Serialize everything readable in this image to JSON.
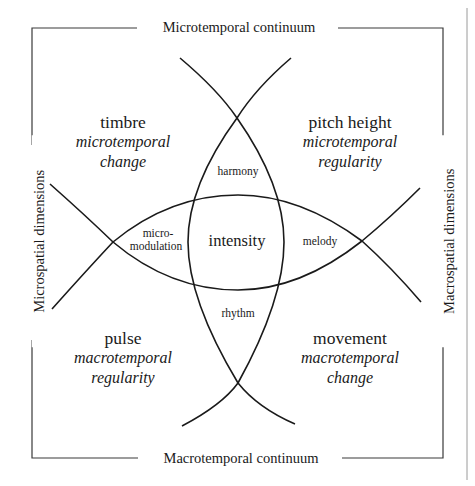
{
  "frame": {
    "top_label": "Microtemporal continuum",
    "bottom_label": "Macrotemporal continuum",
    "left_label": "Microspatial dimensions",
    "right_label": "Macrospatial dimensions"
  },
  "quadrants": {
    "top_left": {
      "title": "timbre",
      "line1": "microtemporal",
      "line2": "change"
    },
    "top_right": {
      "title": "pitch height",
      "line1": "microtemporal",
      "line2": "regularity"
    },
    "bottom_left": {
      "title": "pulse",
      "line1": "macrotemporal",
      "line2": "regularity"
    },
    "bottom_right": {
      "title": "movement",
      "line1": "macrotemporal",
      "line2": "change"
    }
  },
  "regions": {
    "top": "harmony",
    "bottom": "rhythm",
    "left_line1": "micro-",
    "left_line2": "modulation",
    "right": "melody",
    "center": "intensity"
  },
  "colors": {
    "ink": "#1a1a1a",
    "frame": "#3a3a3a",
    "page_edge": "#9a9a9a",
    "background": "#ffffff"
  }
}
